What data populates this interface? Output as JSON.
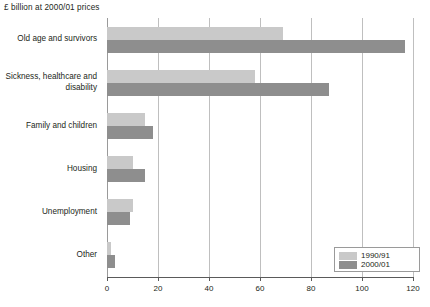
{
  "chart_data": {
    "type": "bar",
    "orientation": "horizontal",
    "title": "£ billion at 2000/01 prices",
    "xlabel": "",
    "ylabel": "",
    "xlim": [
      0,
      120
    ],
    "xticks": [
      0,
      20,
      40,
      60,
      80,
      100,
      120
    ],
    "xtick_labels": [
      "0",
      "20",
      "40",
      "60",
      "80",
      "100",
      "120"
    ],
    "grid": true,
    "grid_axis": "x",
    "legend_position": "bottom-right",
    "categories": [
      "Old age and survivors",
      "Sickness, healthcare and disability",
      "Family and children",
      "Housing",
      "Unemployment",
      "Other"
    ],
    "series": [
      {
        "name": "1990/91",
        "color": "#c9c9c9",
        "values": [
          69,
          58,
          15,
          10,
          10,
          1.5
        ]
      },
      {
        "name": "2000/01",
        "color": "#8e8e8e",
        "values": [
          117,
          87,
          18,
          15,
          9,
          3
        ]
      }
    ]
  },
  "legend": {
    "items": [
      {
        "label": "1990/91"
      },
      {
        "label": "2000/01"
      }
    ]
  }
}
